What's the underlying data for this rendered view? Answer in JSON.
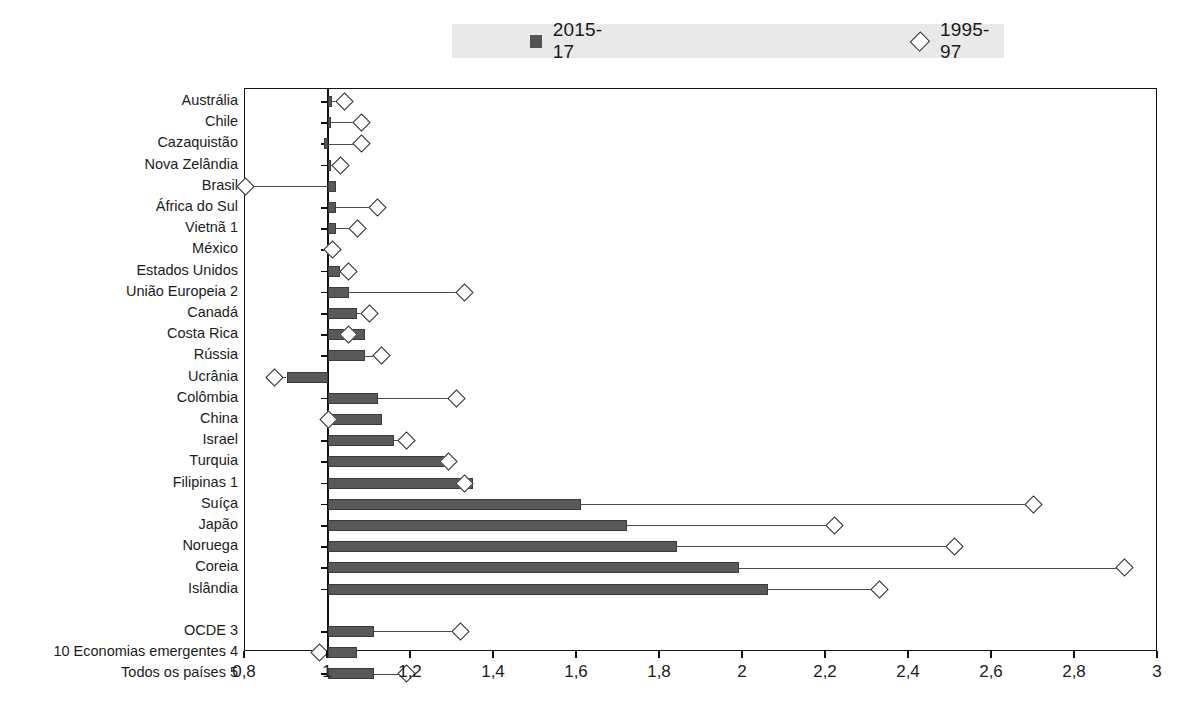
{
  "legend": {
    "series": [
      {
        "label": "2015-17",
        "marker": "filled-square",
        "color": "#595959"
      },
      {
        "label": "1995-97",
        "marker": "open-diamond",
        "color": "#ffffff"
      }
    ]
  },
  "chart_data": {
    "type": "bar",
    "title": "",
    "subtitle": "",
    "xlabel": "",
    "ylabel": "",
    "xlim": [
      0.8,
      3.0
    ],
    "xticks": [
      0.8,
      1.0,
      1.2,
      1.4,
      1.6,
      1.8,
      2.0,
      2.2,
      2.4,
      2.6,
      2.8,
      3.0
    ],
    "xtick_labels": [
      "0,8",
      "1",
      "1,2",
      "1,4",
      "1,6",
      "1,8",
      "2",
      "2,2",
      "2,4",
      "2,6",
      "2,8",
      "3"
    ],
    "grid": false,
    "legend_position": "top-center",
    "baseline": 1.0,
    "orientation": "horizontal",
    "categories": [
      "Austrália",
      "Chile",
      "Cazaquistão",
      "Nova Zelândia",
      "Brasil",
      "África do Sul",
      "Vietnã 1",
      "México",
      "Estados Unidos",
      "União Europeia 2",
      "Canadá",
      "Costa Rica",
      "Rússia",
      "Ucrânia",
      "Colômbia",
      "China",
      "Israel",
      "Turquia",
      "Filipinas 1",
      "Suíça",
      "Japão",
      "Noruega",
      "Coreia",
      "Islândia",
      "",
      "OCDE 3",
      "10 Economias emergentes 4",
      "Todos os países 5"
    ],
    "series": [
      {
        "name": "2015-17",
        "values": [
          1.01,
          1.0,
          0.99,
          1.0,
          1.02,
          1.02,
          1.02,
          1.01,
          1.03,
          1.05,
          1.07,
          1.09,
          1.09,
          0.9,
          1.12,
          1.13,
          1.16,
          1.28,
          1.35,
          1.61,
          1.72,
          1.84,
          1.99,
          2.06,
          null,
          1.11,
          1.07,
          1.11
        ]
      },
      {
        "name": "1995-97",
        "values": [
          1.04,
          1.08,
          1.08,
          1.03,
          0.8,
          1.12,
          1.07,
          1.01,
          1.05,
          1.33,
          1.1,
          1.05,
          1.13,
          0.87,
          1.31,
          1.0,
          1.19,
          1.29,
          1.33,
          2.7,
          2.22,
          2.51,
          2.92,
          2.33,
          null,
          1.32,
          0.98,
          1.19
        ]
      }
    ]
  }
}
